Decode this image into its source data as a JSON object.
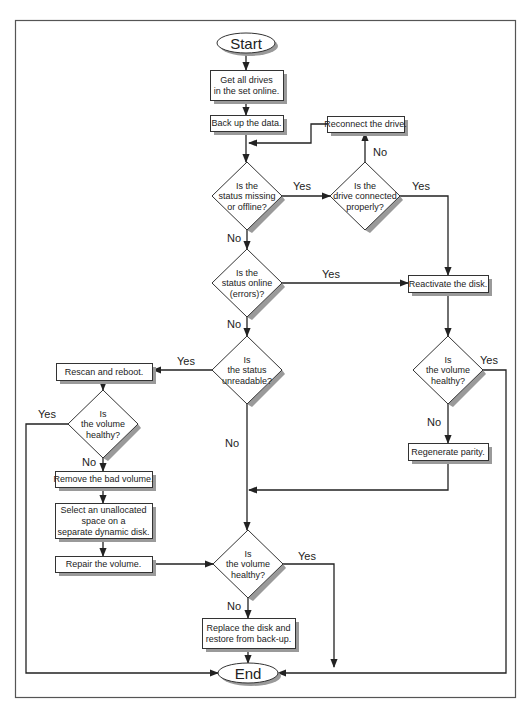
{
  "diagram": {
    "type": "flowchart",
    "nodes": {
      "start": {
        "label": "Start",
        "shape": "terminator"
      },
      "get_online": {
        "label": [
          "Get all drives",
          "in the set online."
        ],
        "shape": "process"
      },
      "backup": {
        "label": [
          "Back up the data."
        ],
        "shape": "process"
      },
      "reconnect": {
        "label": [
          "Reconnect the drive."
        ],
        "shape": "process"
      },
      "q_missing": {
        "label": [
          "Is the",
          "status missing",
          "or offline?"
        ],
        "shape": "decision"
      },
      "q_connected": {
        "label": [
          "Is the",
          "drive connected",
          "properly?"
        ],
        "shape": "decision"
      },
      "q_online_err": {
        "label": [
          "Is the",
          "status online",
          "(errors)?"
        ],
        "shape": "decision"
      },
      "reactivate": {
        "label": [
          "Reactivate the disk."
        ],
        "shape": "process"
      },
      "q_unreadable": {
        "label": [
          "Is",
          "the status",
          "unreadable?"
        ],
        "shape": "decision"
      },
      "rescan": {
        "label": [
          "Rescan and reboot."
        ],
        "shape": "process"
      },
      "q_healthy_left": {
        "label": [
          "Is",
          "the volume",
          "healthy?"
        ],
        "shape": "decision"
      },
      "q_healthy_right": {
        "label": [
          "Is",
          "the volume",
          "healthy?"
        ],
        "shape": "decision"
      },
      "regenerate": {
        "label": [
          "Regenerate parity."
        ],
        "shape": "process"
      },
      "remove": {
        "label": [
          "Remove the bad volume."
        ],
        "shape": "process"
      },
      "select_space": {
        "label": [
          "Select an unallocated",
          "space on a",
          "separate dynamic disk."
        ],
        "shape": "process"
      },
      "repair": {
        "label": [
          "Repair the volume."
        ],
        "shape": "process"
      },
      "q_healthy_bottom": {
        "label": [
          "Is",
          "the volume",
          "healthy?"
        ],
        "shape": "decision"
      },
      "replace": {
        "label": [
          "Replace the disk and",
          "restore from back-up."
        ],
        "shape": "process"
      },
      "end": {
        "label": "End",
        "shape": "terminator"
      }
    },
    "edges": [
      {
        "from": "start",
        "to": "get_online",
        "label": ""
      },
      {
        "from": "get_online",
        "to": "backup",
        "label": ""
      },
      {
        "from": "backup",
        "to": "q_missing",
        "label": ""
      },
      {
        "from": "q_missing",
        "to": "q_connected",
        "label": "Yes"
      },
      {
        "from": "q_connected",
        "to": "reconnect",
        "label": "No"
      },
      {
        "from": "reconnect",
        "to": "q_missing",
        "label": ""
      },
      {
        "from": "q_connected",
        "to": "reactivate",
        "label": "Yes"
      },
      {
        "from": "q_missing",
        "to": "q_online_err",
        "label": "No"
      },
      {
        "from": "q_online_err",
        "to": "reactivate",
        "label": "Yes"
      },
      {
        "from": "q_online_err",
        "to": "q_unreadable",
        "label": "No"
      },
      {
        "from": "reactivate",
        "to": "q_healthy_right",
        "label": ""
      },
      {
        "from": "q_healthy_right",
        "to": "end",
        "label": "Yes"
      },
      {
        "from": "q_healthy_right",
        "to": "regenerate",
        "label": "No"
      },
      {
        "from": "regenerate",
        "to": "q_healthy_bottom",
        "label": ""
      },
      {
        "from": "q_unreadable",
        "to": "rescan",
        "label": "Yes"
      },
      {
        "from": "q_unreadable",
        "to": "q_healthy_bottom",
        "label": "No"
      },
      {
        "from": "rescan",
        "to": "q_healthy_left",
        "label": ""
      },
      {
        "from": "q_healthy_left",
        "to": "end",
        "label": "Yes"
      },
      {
        "from": "q_healthy_left",
        "to": "remove",
        "label": "No"
      },
      {
        "from": "remove",
        "to": "select_space",
        "label": ""
      },
      {
        "from": "select_space",
        "to": "repair",
        "label": ""
      },
      {
        "from": "repair",
        "to": "q_healthy_bottom",
        "label": ""
      },
      {
        "from": "q_healthy_bottom",
        "to": "end",
        "label": "Yes"
      },
      {
        "from": "q_healthy_bottom",
        "to": "replace",
        "label": "No"
      },
      {
        "from": "replace",
        "to": "end",
        "label": ""
      }
    ],
    "edge_labels": {
      "yes": "Yes",
      "no": "No"
    }
  }
}
